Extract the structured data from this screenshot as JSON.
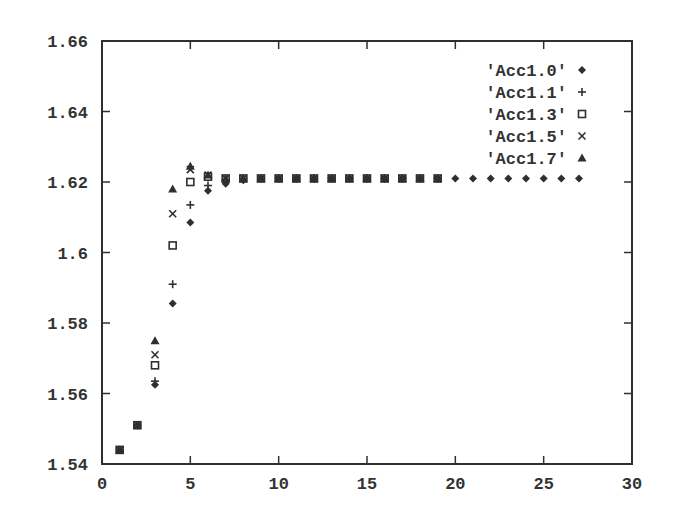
{
  "chart_data": {
    "type": "scatter",
    "title": "",
    "xlabel": "",
    "ylabel": "",
    "xlim": [
      0,
      30
    ],
    "ylim": [
      1.54,
      1.66
    ],
    "x_ticks": [
      0,
      5,
      10,
      15,
      20,
      25,
      30
    ],
    "y_ticks": [
      1.54,
      1.56,
      1.58,
      1.6,
      1.62,
      1.64,
      1.66
    ],
    "x_tick_labels": [
      "0",
      "5",
      "10",
      "15",
      "20",
      "25",
      "30"
    ],
    "y_tick_labels": [
      "1.54",
      "1.56",
      "1.58",
      "1.6",
      "1.62",
      "1.64",
      "1.66"
    ],
    "grid": false,
    "legend_position": "upper right",
    "series": [
      {
        "name": "'Acc1.0'",
        "marker": "diamond",
        "x": [
          1,
          2,
          3,
          4,
          5,
          6,
          7,
          8,
          9,
          10,
          11,
          12,
          13,
          14,
          15,
          16,
          17,
          18,
          19,
          20,
          21,
          22,
          23,
          24,
          25,
          26,
          27
        ],
        "values": [
          1.544,
          1.551,
          1.5625,
          1.5855,
          1.6085,
          1.6175,
          1.6195,
          1.6205,
          1.621,
          1.621,
          1.621,
          1.621,
          1.621,
          1.621,
          1.621,
          1.621,
          1.621,
          1.621,
          1.621,
          1.621,
          1.621,
          1.621,
          1.621,
          1.621,
          1.621,
          1.621,
          1.621
        ]
      },
      {
        "name": "'Acc1.1'",
        "marker": "plus",
        "x": [
          1,
          2,
          3,
          4,
          5,
          6,
          7,
          8,
          9,
          10,
          11,
          12,
          13,
          14,
          15,
          16,
          17,
          18,
          19
        ],
        "values": [
          1.544,
          1.551,
          1.5635,
          1.591,
          1.6135,
          1.619,
          1.6205,
          1.621,
          1.621,
          1.621,
          1.621,
          1.621,
          1.621,
          1.621,
          1.621,
          1.621,
          1.621,
          1.621,
          1.621
        ]
      },
      {
        "name": "'Acc1.3'",
        "marker": "square",
        "x": [
          1,
          2,
          3,
          4,
          5,
          6,
          7,
          8,
          9,
          10,
          11,
          12,
          13,
          14,
          15,
          16,
          17,
          18,
          19
        ],
        "values": [
          1.544,
          1.551,
          1.568,
          1.602,
          1.62,
          1.6215,
          1.621,
          1.621,
          1.621,
          1.621,
          1.621,
          1.621,
          1.621,
          1.621,
          1.621,
          1.621,
          1.621,
          1.621,
          1.621
        ]
      },
      {
        "name": "'Acc1.5'",
        "marker": "cross",
        "x": [
          1,
          2,
          3,
          4,
          5,
          6,
          7,
          8,
          9,
          10,
          11,
          12,
          13,
          14,
          15,
          16,
          17,
          18,
          19
        ],
        "values": [
          1.544,
          1.551,
          1.571,
          1.611,
          1.6235,
          1.622,
          1.621,
          1.621,
          1.621,
          1.621,
          1.621,
          1.621,
          1.621,
          1.621,
          1.621,
          1.621,
          1.621,
          1.621,
          1.621
        ]
      },
      {
        "name": "'Acc1.7'",
        "marker": "triangle",
        "x": [
          1,
          2,
          3,
          4,
          5,
          6,
          7,
          8,
          9,
          10,
          11,
          12,
          13,
          14,
          15,
          16,
          17,
          18,
          19
        ],
        "values": [
          1.544,
          1.551,
          1.575,
          1.618,
          1.6245,
          1.622,
          1.621,
          1.621,
          1.621,
          1.621,
          1.621,
          1.621,
          1.621,
          1.621,
          1.621,
          1.621,
          1.621,
          1.621,
          1.621
        ]
      }
    ]
  },
  "style": {
    "ink_color": "#2f2f2f",
    "background": "#ffffff"
  }
}
